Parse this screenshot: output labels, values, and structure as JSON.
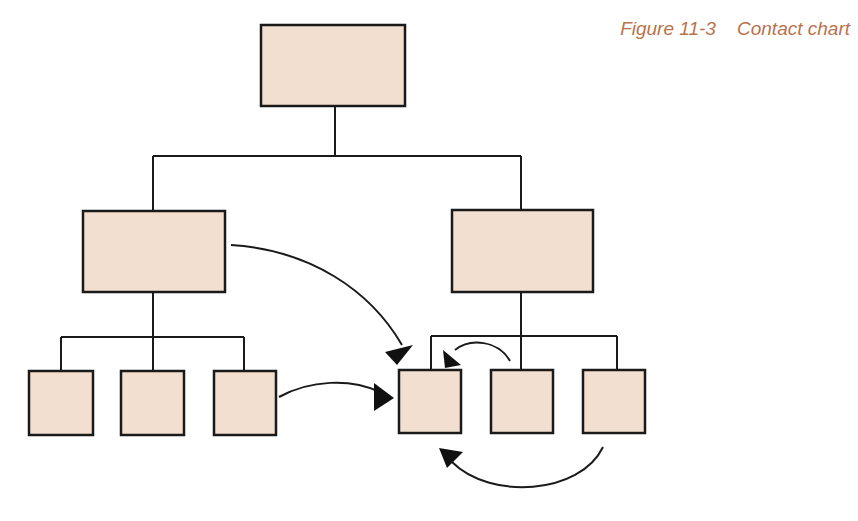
{
  "figure": {
    "caption": "Figure 11-3    Contact chart",
    "figure_number": "Figure 11-3",
    "title": "Contact chart"
  },
  "colors": {
    "box_fill": "#f3dfd0",
    "stroke": "#1a1a1a",
    "caption": "#b8734c"
  },
  "org_chart": {
    "levels": [
      {
        "level": 1,
        "boxes": [
          "top"
        ]
      },
      {
        "level": 2,
        "boxes": [
          "mid-left",
          "mid-right"
        ]
      },
      {
        "level": 3,
        "boxes": [
          "bottom-1",
          "bottom-2",
          "bottom-3",
          "bottom-4",
          "bottom-5",
          "bottom-6"
        ]
      }
    ],
    "contacts": [
      {
        "from": "mid-left",
        "to": "bottom-4"
      },
      {
        "from": "bottom-3",
        "to": "bottom-4"
      },
      {
        "from": "bottom-5",
        "to": "bottom-4"
      },
      {
        "from": "bottom-6",
        "to": "bottom-4"
      }
    ]
  }
}
